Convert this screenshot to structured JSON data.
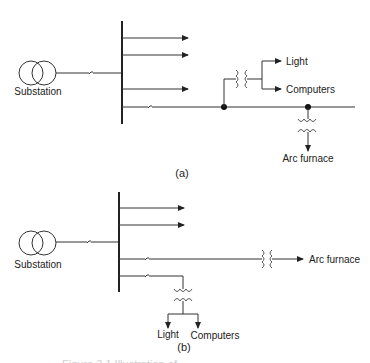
{
  "diagram": {
    "type": "single-line power distribution diagram",
    "panels": [
      {
        "id": "a",
        "caption": "(a)",
        "source_label": "Substation",
        "bus_outgoing_arrows": 3,
        "loads": [
          {
            "label": "Light"
          },
          {
            "label": "Computers"
          },
          {
            "label": "Arc furnace"
          }
        ],
        "description": "Light and computers share a feeder with the arc furnace"
      },
      {
        "id": "b",
        "caption": "(b)",
        "source_label": "Substation",
        "bus_outgoing_arrows": 2,
        "loads": [
          {
            "label": "Arc furnace"
          },
          {
            "label": "Light"
          },
          {
            "label": "Computers"
          }
        ],
        "description": "Arc furnace on a separate feeder from light and computers"
      }
    ],
    "figure_caption_partial": "Figure 3.1  Illustration of ..."
  },
  "labels": {
    "a_substation": "Substation",
    "a_light": "Light",
    "a_computers": "Computers",
    "a_arc": "Arc furnace",
    "a_caption": "(a)",
    "b_substation": "Substation",
    "b_arc": "Arc furnace",
    "b_light": "Light",
    "b_computers": "Computers",
    "b_caption": "(b)",
    "figure_caption": "Figure 3.1  Illustration of ..."
  }
}
